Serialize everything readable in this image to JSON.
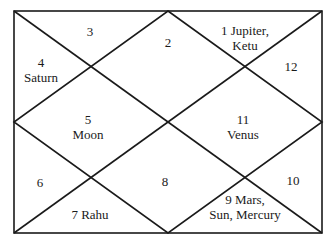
{
  "chart": {
    "type": "north-indian-horoscope",
    "line_color": "#1a1a1a",
    "background": "#ffffff",
    "houses": [
      {
        "house": 1,
        "label": "1 Jupiter,",
        "label2": "Ketu",
        "planets": [
          "Jupiter",
          "Ketu"
        ]
      },
      {
        "house": 2,
        "label": "2",
        "planets": []
      },
      {
        "house": 3,
        "label": "3",
        "planets": []
      },
      {
        "house": 4,
        "label": "4",
        "label2": "Saturn",
        "planets": [
          "Saturn"
        ]
      },
      {
        "house": 5,
        "label": "5",
        "label2": "Moon",
        "planets": [
          "Moon"
        ]
      },
      {
        "house": 6,
        "label": "6",
        "planets": []
      },
      {
        "house": 7,
        "label": "7  Rahu",
        "planets": [
          "Rahu"
        ]
      },
      {
        "house": 8,
        "label": "8",
        "planets": []
      },
      {
        "house": 9,
        "label": "9  Mars,",
        "label2": "Sun,  Mercury",
        "planets": [
          "Mars",
          "Sun",
          "Mercury"
        ]
      },
      {
        "house": 10,
        "label": "10",
        "planets": []
      },
      {
        "house": 11,
        "label": "11",
        "label2": "Venus",
        "planets": [
          "Venus"
        ]
      },
      {
        "house": 12,
        "label": "12",
        "planets": []
      }
    ]
  }
}
